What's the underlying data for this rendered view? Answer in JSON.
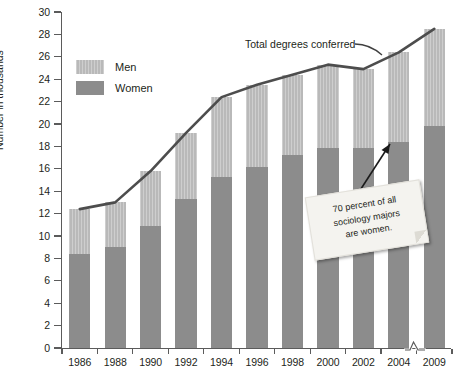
{
  "chart_data": {
    "type": "bar",
    "subtype": "stacked-bar-with-overlay-line",
    "title": "",
    "xlabel": "",
    "ylabel": "Number in thousands",
    "ylim": [
      0,
      30
    ],
    "ytick_step": 2,
    "yticks": [
      0,
      2,
      4,
      6,
      8,
      10,
      12,
      14,
      16,
      18,
      20,
      22,
      24,
      26,
      28,
      30
    ],
    "grid": false,
    "legend_position": "upper-left-inside",
    "categories": [
      "1986",
      "1988",
      "1990",
      "1992",
      "1994",
      "1996",
      "1998",
      "2000",
      "2002",
      "2004",
      "2009"
    ],
    "axis_break_between": [
      "2004",
      "2009"
    ],
    "series": [
      {
        "name": "Women",
        "values": [
          8.4,
          9.0,
          10.9,
          13.3,
          15.3,
          16.2,
          17.2,
          17.9,
          17.9,
          18.4,
          19.8
        ]
      },
      {
        "name": "Men",
        "values": [
          4.0,
          4.0,
          4.9,
          5.9,
          7.1,
          7.3,
          7.2,
          7.4,
          7.0,
          8.0,
          8.7
        ]
      }
    ],
    "overlay_line": {
      "name": "Total degrees conferred",
      "values": [
        12.4,
        13.0,
        15.8,
        19.2,
        22.4,
        23.5,
        24.4,
        25.3,
        24.9,
        26.4,
        28.5
      ]
    },
    "annotations": [
      {
        "name": "total-line-callout",
        "text": "Total degrees conferred"
      },
      {
        "name": "sticky-note",
        "text": "70 percent of all sociology majors are women."
      }
    ]
  },
  "legend": {
    "items": [
      {
        "label": "Men",
        "color": "#b9b9b9"
      },
      {
        "label": "Women",
        "color": "#8c8c8c"
      }
    ]
  },
  "axes": {
    "y_title": "Number in thousands",
    "y_tick_labels": [
      "30",
      "28",
      "26",
      "24",
      "22",
      "20",
      "18",
      "16",
      "14",
      "12",
      "10",
      "8",
      "6",
      "4",
      "2",
      "0"
    ],
    "x_tick_labels": [
      "1986",
      "1988",
      "1990",
      "1992",
      "1994",
      "1996",
      "1998",
      "2000",
      "2002",
      "2004",
      "2009"
    ]
  },
  "annotations": {
    "total_label": "Total degrees conferred",
    "sticky_line1": "70 percent of all",
    "sticky_line2": "sociology majors",
    "sticky_line3": "are women."
  },
  "colors": {
    "men": "#b9b9b9",
    "women": "#8c8c8c",
    "line": "#4d4d4d",
    "axis": "#5b5b5b",
    "text": "#231f20",
    "sticky": "#f4f3ef"
  }
}
